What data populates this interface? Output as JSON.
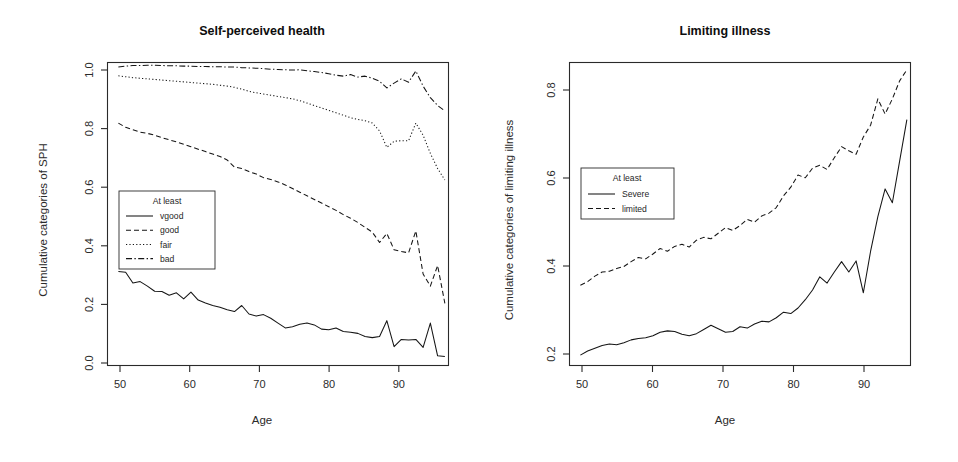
{
  "figure": {
    "background": "#ffffff",
    "ink_color": "#151515"
  },
  "chart_data": [
    {
      "type": "line",
      "panel": "left",
      "title": "Self-perceived health",
      "xlabel": "Age",
      "ylabel": "Cumulative categories of SPH",
      "xlim": [
        48.5,
        95.5
      ],
      "ylim": [
        0.0,
        1.0
      ],
      "xticks": [
        50,
        60,
        70,
        80,
        90
      ],
      "xticklabels": [
        "50",
        "60",
        "70",
        "80",
        "90"
      ],
      "yticks": [
        0.0,
        0.2,
        0.4,
        0.6,
        0.8,
        1.0
      ],
      "yticklabels": [
        "0.0",
        "0.2",
        "0.4",
        "0.6",
        "0.8",
        "1.0"
      ],
      "grid": false,
      "legend": {
        "title": "At least",
        "position": "lower-left",
        "entries": [
          {
            "label": "vgood",
            "dash": "solid"
          },
          {
            "label": "good",
            "dash": "dashed"
          },
          {
            "label": "fair",
            "dash": "dotted"
          },
          {
            "label": "bad",
            "dash": "dashdot"
          }
        ]
      },
      "x": [
        50,
        51,
        52,
        53,
        54,
        55,
        56,
        57,
        58,
        59,
        60,
        61,
        62,
        63,
        64,
        65,
        66,
        67,
        68,
        69,
        70,
        71,
        72,
        73,
        74,
        75,
        76,
        77,
        78,
        79,
        80,
        81,
        82,
        83,
        84,
        85,
        86,
        87,
        88,
        89,
        90,
        91,
        92,
        93,
        94,
        95
      ],
      "series": [
        {
          "name": "bad",
          "dash": "dashdot",
          "values": [
            0.985,
            0.988,
            0.99,
            0.99,
            0.991,
            0.991,
            0.99,
            0.989,
            0.989,
            0.988,
            0.988,
            0.987,
            0.987,
            0.986,
            0.986,
            0.985,
            0.985,
            0.983,
            0.982,
            0.981,
            0.98,
            0.978,
            0.977,
            0.976,
            0.975,
            0.976,
            0.973,
            0.97,
            0.967,
            0.963,
            0.958,
            0.955,
            0.96,
            0.952,
            0.955,
            0.948,
            0.938,
            0.916,
            0.932,
            0.946,
            0.935,
            0.972,
            0.922,
            0.884,
            0.858,
            0.84
          ]
        },
        {
          "name": "fair",
          "dash": "dotted",
          "values": [
            0.956,
            0.953,
            0.95,
            0.948,
            0.946,
            0.944,
            0.942,
            0.94,
            0.938,
            0.936,
            0.934,
            0.932,
            0.93,
            0.928,
            0.925,
            0.922,
            0.918,
            0.912,
            0.905,
            0.9,
            0.896,
            0.892,
            0.888,
            0.884,
            0.88,
            0.874,
            0.866,
            0.858,
            0.85,
            0.842,
            0.834,
            0.826,
            0.818,
            0.812,
            0.808,
            0.8,
            0.774,
            0.72,
            0.74,
            0.742,
            0.742,
            0.8,
            0.76,
            0.7,
            0.65,
            0.612
          ]
        },
        {
          "name": "good",
          "dash": "dashed",
          "values": [
            0.8,
            0.786,
            0.778,
            0.77,
            0.766,
            0.76,
            0.752,
            0.745,
            0.738,
            0.73,
            0.722,
            0.714,
            0.706,
            0.698,
            0.69,
            0.678,
            0.655,
            0.65,
            0.64,
            0.632,
            0.62,
            0.614,
            0.606,
            0.596,
            0.584,
            0.572,
            0.56,
            0.548,
            0.536,
            0.524,
            0.512,
            0.498,
            0.486,
            0.472,
            0.456,
            0.44,
            0.406,
            0.436,
            0.382,
            0.376,
            0.372,
            0.444,
            0.302,
            0.262,
            0.33,
            0.205
          ]
        },
        {
          "name": "vgood",
          "dash": "solid",
          "values": [
            0.31,
            0.308,
            0.272,
            0.277,
            0.262,
            0.245,
            0.244,
            0.232,
            0.24,
            0.22,
            0.242,
            0.216,
            0.206,
            0.198,
            0.192,
            0.184,
            0.178,
            0.198,
            0.17,
            0.163,
            0.168,
            0.156,
            0.14,
            0.124,
            0.128,
            0.136,
            0.14,
            0.134,
            0.12,
            0.118,
            0.124,
            0.112,
            0.11,
            0.106,
            0.096,
            0.092,
            0.096,
            0.148,
            0.062,
            0.086,
            0.084,
            0.086,
            0.06,
            0.14,
            0.032,
            0.03
          ]
        }
      ]
    },
    {
      "type": "line",
      "panel": "right",
      "title": "Limiting illness",
      "xlabel": "Age",
      "ylabel": "Cumulative categories of limiting illness",
      "xlim": [
        48.5,
        95.5
      ],
      "ylim": [
        0.03,
        0.905
      ],
      "xticks": [
        50,
        60,
        70,
        80,
        90
      ],
      "xticklabels": [
        "50",
        "60",
        "70",
        "80",
        "90"
      ],
      "yticks": [
        0.2,
        0.4,
        0.6,
        0.8
      ],
      "yticklabels": [
        "0.2",
        "0.4",
        "0.6",
        "0.8"
      ],
      "grid": false,
      "legend": {
        "title": "At least",
        "position": "middle-left",
        "entries": [
          {
            "label": "Severe",
            "dash": "solid"
          },
          {
            "label": "limited",
            "dash": "dashed"
          }
        ]
      },
      "x": [
        50,
        51,
        52,
        53,
        54,
        55,
        56,
        57,
        58,
        59,
        60,
        61,
        62,
        63,
        64,
        65,
        66,
        67,
        68,
        69,
        70,
        71,
        72,
        73,
        74,
        75,
        76,
        77,
        78,
        79,
        80,
        81,
        82,
        83,
        84,
        85,
        86,
        87,
        88,
        89,
        90,
        91,
        92,
        93,
        94,
        95
      ],
      "series": [
        {
          "name": "limited",
          "dash": "dashed",
          "values": [
            0.262,
            0.272,
            0.288,
            0.3,
            0.302,
            0.31,
            0.316,
            0.33,
            0.342,
            0.338,
            0.352,
            0.368,
            0.36,
            0.374,
            0.38,
            0.372,
            0.392,
            0.4,
            0.396,
            0.412,
            0.428,
            0.42,
            0.434,
            0.452,
            0.444,
            0.462,
            0.47,
            0.486,
            0.52,
            0.545,
            0.58,
            0.572,
            0.6,
            0.608,
            0.596,
            0.63,
            0.662,
            0.65,
            0.64,
            0.69,
            0.724,
            0.8,
            0.756,
            0.8,
            0.852,
            0.884
          ]
        },
        {
          "name": "Severe",
          "dash": "solid",
          "values": [
            0.06,
            0.072,
            0.08,
            0.088,
            0.092,
            0.09,
            0.096,
            0.104,
            0.108,
            0.11,
            0.116,
            0.126,
            0.13,
            0.128,
            0.12,
            0.116,
            0.122,
            0.134,
            0.146,
            0.136,
            0.126,
            0.128,
            0.142,
            0.138,
            0.15,
            0.158,
            0.156,
            0.168,
            0.184,
            0.18,
            0.196,
            0.22,
            0.248,
            0.286,
            0.268,
            0.3,
            0.33,
            0.3,
            0.332,
            0.24,
            0.36,
            0.46,
            0.54,
            0.5,
            0.62,
            0.74
          ]
        }
      ]
    }
  ]
}
